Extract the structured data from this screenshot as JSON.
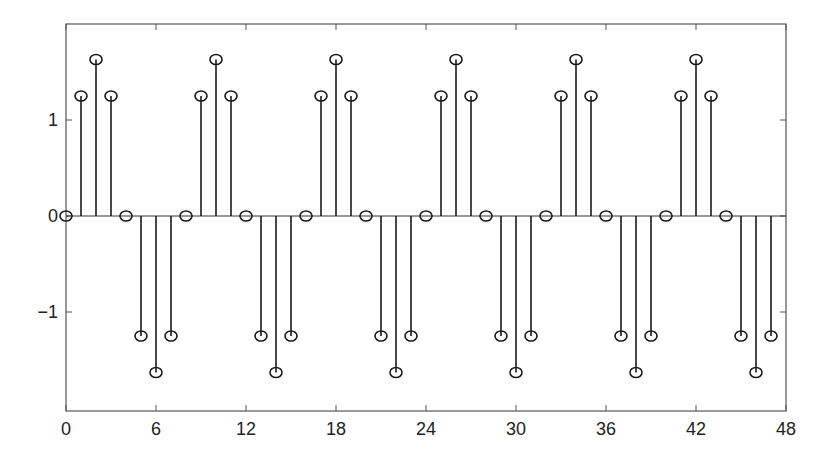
{
  "chart_data": {
    "type": "stem",
    "title": "",
    "xlabel": "",
    "ylabel": "",
    "xlim": [
      0,
      48
    ],
    "ylim": [
      -2,
      2
    ],
    "grid": false,
    "legend": null,
    "xticks": [
      0,
      6,
      12,
      18,
      24,
      30,
      36,
      42,
      48
    ],
    "xtick_labels": [
      "0",
      "6",
      "12",
      "18",
      "24",
      "30",
      "36",
      "42",
      "48"
    ],
    "yticks": [
      -1,
      0,
      1
    ],
    "ytick_labels": [
      "−1",
      "0",
      "1"
    ],
    "marker": "circle-open",
    "period": 8,
    "series": [
      {
        "name": "x[n]",
        "x": [
          0,
          1,
          2,
          3,
          4,
          5,
          6,
          7,
          8,
          9,
          10,
          11,
          12,
          13,
          14,
          15,
          16,
          17,
          18,
          19,
          20,
          21,
          22,
          23,
          24,
          25,
          26,
          27,
          28,
          29,
          30,
          31,
          32,
          33,
          34,
          35,
          36,
          37,
          38,
          39,
          40,
          41,
          42,
          43,
          44,
          45,
          46,
          47
        ],
        "values": [
          0,
          1.25,
          1.63,
          1.25,
          0,
          -1.25,
          -1.63,
          -1.25,
          0,
          1.25,
          1.63,
          1.25,
          0,
          -1.25,
          -1.63,
          -1.25,
          0,
          1.25,
          1.63,
          1.25,
          0,
          -1.25,
          -1.63,
          -1.25,
          0,
          1.25,
          1.63,
          1.25,
          0,
          -1.25,
          -1.63,
          -1.25,
          0,
          1.25,
          1.63,
          1.25,
          0,
          -1.25,
          -1.63,
          -1.25,
          0,
          1.25,
          1.63,
          1.25,
          0,
          -1.25,
          -1.63,
          -1.25
        ]
      }
    ]
  },
  "style": {
    "axis_color": "#555555",
    "stem_color": "#1a1a1a",
    "background": "#ffffff"
  }
}
